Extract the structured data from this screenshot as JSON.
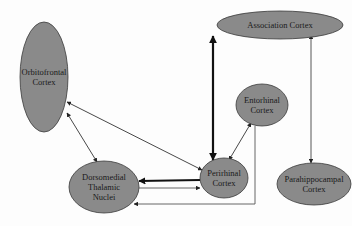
{
  "diagram": {
    "type": "brain-connectivity-network",
    "colors": {
      "node_fill": "#8a8a8a",
      "node_stroke": "#3a3a3a",
      "edge": "#2a2a2a",
      "edge_light": "#555555",
      "background": "#fdfdfd"
    },
    "nodes": [
      {
        "id": "orbitofrontal",
        "lines": [
          "Orbitofrontal",
          "Cortex"
        ],
        "cx": 44,
        "cy": 77,
        "rx": 24,
        "ry": 55
      },
      {
        "id": "association",
        "lines": [
          "Association Cortex"
        ],
        "cx": 280,
        "cy": 25,
        "rx": 63,
        "ry": 14
      },
      {
        "id": "entorhinal",
        "lines": [
          "Entorhinal",
          "Cortex"
        ],
        "cx": 262,
        "cy": 105,
        "rx": 26,
        "ry": 21
      },
      {
        "id": "dorsomedial",
        "lines": [
          "Dorsomedial",
          "Thalamic",
          "Nuclei"
        ],
        "cx": 104,
        "cy": 187,
        "rx": 35,
        "ry": 26
      },
      {
        "id": "perirhinal",
        "lines": [
          "Perirhinal",
          "Cortex"
        ],
        "cx": 224,
        "cy": 178,
        "rx": 24,
        "ry": 20
      },
      {
        "id": "parahippocampal",
        "lines": [
          "Parahippocampal",
          "Cortex"
        ],
        "cx": 314,
        "cy": 184,
        "rx": 37,
        "ry": 21
      }
    ],
    "edges": [
      {
        "from": "perirhinal",
        "to": "association",
        "direction": "both",
        "weight": "thick"
      },
      {
        "from": "parahippocampal",
        "to": "association",
        "direction": "both",
        "weight": "thin"
      },
      {
        "from": "entorhinal",
        "to": "perirhinal",
        "direction": "both",
        "weight": "thin"
      },
      {
        "from": "orbitofrontal",
        "to": "perirhinal",
        "direction": "both",
        "weight": "thin"
      },
      {
        "from": "orbitofrontal",
        "to": "dorsomedial",
        "direction": "both",
        "weight": "thin"
      },
      {
        "from": "perirhinal",
        "to": "dorsomedial",
        "direction": "forward",
        "weight": "thick"
      },
      {
        "from": "dorsomedial",
        "to": "perirhinal",
        "direction": "forward",
        "weight": "thin"
      },
      {
        "from": "entorhinal",
        "to": "dorsomedial",
        "direction": "forward",
        "weight": "thin"
      }
    ]
  }
}
